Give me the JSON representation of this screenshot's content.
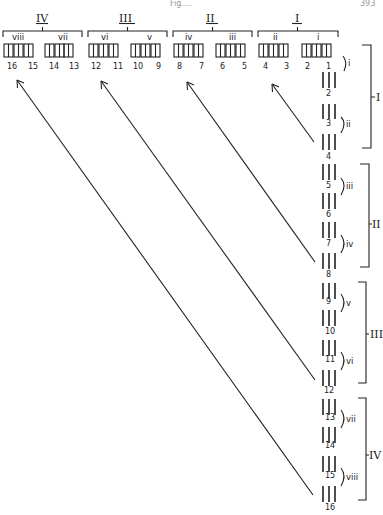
{
  "header": {
    "left_text": "Fig....",
    "page_number": "393"
  },
  "top_row": {
    "groups": [
      {
        "label": "IV",
        "subgroups": [
          "viii",
          "vii"
        ],
        "numbers": [
          "16",
          "15",
          "14",
          "13"
        ]
      },
      {
        "label": "III",
        "subgroups": [
          "vi",
          "v"
        ],
        "numbers": [
          "12",
          "11",
          "10",
          "9"
        ]
      },
      {
        "label": "II",
        "subgroups": [
          "iv",
          "iii"
        ],
        "numbers": [
          "8",
          "7",
          "6",
          "5"
        ]
      },
      {
        "label": "I",
        "subgroups": [
          "ii",
          "i"
        ],
        "numbers": [
          "4",
          "3",
          "2",
          "1"
        ]
      }
    ]
  },
  "right_column": {
    "groups": [
      {
        "label": "I",
        "pairs": [
          {
            "label": "i",
            "numbers": [
              "1",
              "2"
            ]
          },
          {
            "label": "ii",
            "numbers": [
              "3",
              "4"
            ]
          }
        ]
      },
      {
        "label": "II",
        "pairs": [
          {
            "label": "iii",
            "numbers": [
              "5",
              "6"
            ]
          },
          {
            "label": "iv",
            "numbers": [
              "7",
              "8"
            ]
          }
        ]
      },
      {
        "label": "III",
        "pairs": [
          {
            "label": "v",
            "numbers": [
              "9",
              "10"
            ]
          },
          {
            "label": "vi",
            "numbers": [
              "11",
              "12"
            ]
          }
        ]
      },
      {
        "label": "IV",
        "pairs": [
          {
            "label": "vii",
            "numbers": [
              "13",
              "14"
            ]
          },
          {
            "label": "viii",
            "numbers": [
              "15",
              "16"
            ]
          }
        ]
      }
    ]
  },
  "arrows": [
    {
      "from": "4",
      "to": "4"
    },
    {
      "from": "8",
      "to": "8"
    },
    {
      "from": "12",
      "to": "12"
    },
    {
      "from": "16",
      "to": "16"
    }
  ]
}
